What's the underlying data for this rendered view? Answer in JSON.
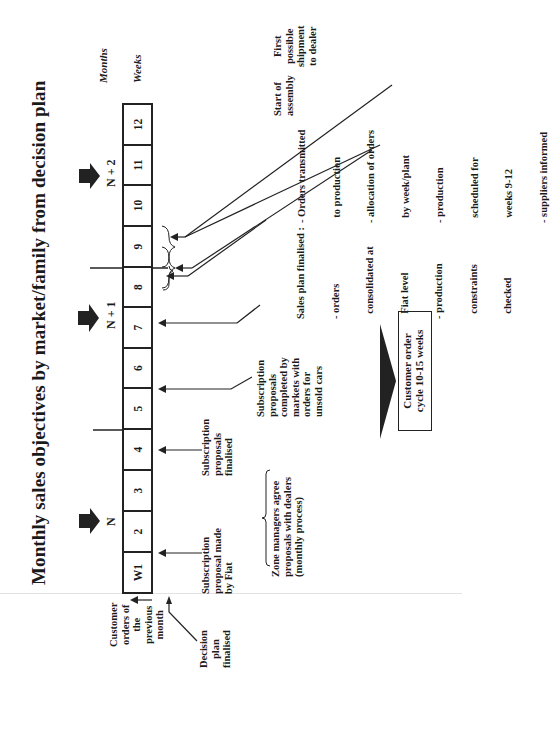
{
  "title": "Monthly sales objectives by market/family from decision plan",
  "axis_labels": {
    "months": "Months",
    "weeks": "Weeks"
  },
  "months": [
    {
      "label": "N"
    },
    {
      "label": "N + 1"
    },
    {
      "label": "N + 2"
    }
  ],
  "weeks": [
    "W1",
    "2",
    "3",
    "4",
    "5",
    "6",
    "7",
    "8",
    "9",
    "10",
    "11",
    "12"
  ],
  "left_labels": {
    "customer_orders": [
      "Customer",
      "orders of",
      "the",
      "previous",
      "month"
    ],
    "decision_plan": [
      "Decision",
      "plan",
      "finalised"
    ]
  },
  "annotations": {
    "subscription_made": [
      "Subscription",
      "proposal made",
      "by Fiat"
    ],
    "subscription_finalised": [
      "Subscription",
      "proposals",
      "finalised"
    ],
    "zone_managers": [
      "Zone managers agree",
      "proposals with dealers",
      "(monthly process)"
    ],
    "subscription_completed": [
      "Subscription",
      "proposals",
      "completed by",
      "markets with",
      "orders for",
      "unsold cars"
    ],
    "sales_plan": [
      "Sales plan finalised :",
      "- orders",
      "  consolidated at",
      "  Fiat level",
      "- production",
      "  constraints",
      "  checked"
    ],
    "orders_transmitted": [
      "- Orders transmitted",
      "  to production",
      "- allocation of orders",
      "  by week/plant",
      "- production",
      "  scheduled for",
      "  weeks 9-12",
      "- suppliers informed"
    ],
    "start_assembly": [
      "Start of",
      "assembly"
    ],
    "first_shipment": [
      "First",
      "possible",
      "shipment",
      "to dealer"
    ]
  },
  "cycle": {
    "label_line1": "Customer order",
    "label_line2": "cycle 10-15 weeks"
  },
  "colors": {
    "ink": "#1a1a1a",
    "background": "#ffffff"
  }
}
